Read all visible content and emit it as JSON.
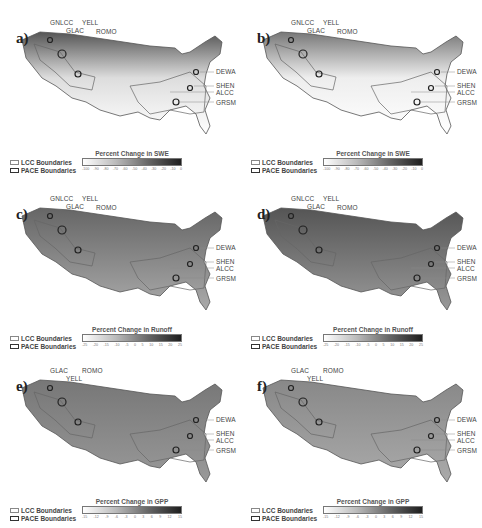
{
  "figure": {
    "panels": [
      {
        "id": "a",
        "label": "a)",
        "variable": "SWE",
        "colorbar_title": "Percent Change in SWE",
        "ticks": [
          "-100",
          "-90",
          "-80",
          "-70",
          "-60",
          "-50",
          "-40",
          "-30",
          "-20",
          "-10",
          "0"
        ],
        "sites_top": [
          "GNLCC",
          "GLAC",
          "YELL",
          "ROMO"
        ],
        "sites_right": [
          "DEWA",
          "SHEN",
          "ALCC",
          "GRSM"
        ]
      },
      {
        "id": "b",
        "label": "b)",
        "variable": "SWE",
        "colorbar_title": "Percent Change in SWE",
        "ticks": [
          "-100",
          "-90",
          "-80",
          "-70",
          "-60",
          "-50",
          "-40",
          "-30",
          "-20",
          "-10",
          "0"
        ],
        "sites_top": [
          "GNLCC",
          "GLAC",
          "YELL",
          "ROMO"
        ],
        "sites_right": [
          "DEWA",
          "SHEN",
          "ALCC",
          "GRSM"
        ]
      },
      {
        "id": "c",
        "label": "c)",
        "variable": "Runoff",
        "colorbar_title": "Percent Change in Runoff",
        "ticks": [
          "-25",
          "-20",
          "-15",
          "-10",
          "-5",
          "0",
          "5",
          "10",
          "15",
          "20",
          "25"
        ],
        "sites_top": [
          "GNLCC",
          "GLAC",
          "YELL",
          "ROMO"
        ],
        "sites_right": [
          "DEWA",
          "SHEN",
          "ALCC",
          "GRSM"
        ]
      },
      {
        "id": "d",
        "label": "d)",
        "variable": "Runoff",
        "colorbar_title": "Percent Change in Runoff",
        "ticks": [
          "-25",
          "-20",
          "-15",
          "-10",
          "-5",
          "0",
          "5",
          "10",
          "15",
          "20",
          "25"
        ],
        "sites_top": [
          "GNLCC",
          "GLAC",
          "YELL",
          "ROMO"
        ],
        "sites_right": [
          "DEWA",
          "SHEN",
          "ALCC",
          "GRSM"
        ]
      },
      {
        "id": "e",
        "label": "e)",
        "variable": "GPP",
        "colorbar_title": "Percent Change in GPP",
        "ticks": [
          "-15",
          "-12",
          "-9",
          "-6",
          "-3",
          "0",
          "3",
          "6",
          "9",
          "12",
          "15"
        ],
        "sites_top": [
          "GLAC",
          "YELL",
          "ROMO"
        ],
        "sites_right": [
          "DEWA",
          "SHEN",
          "ALCC",
          "GRSM"
        ]
      },
      {
        "id": "f",
        "label": "f)",
        "variable": "GPP",
        "colorbar_title": "Percent Change in GPP",
        "ticks": [
          "-15",
          "-12",
          "-9",
          "-6",
          "-3",
          "0",
          "3",
          "6",
          "9",
          "12",
          "15"
        ],
        "sites_top": [
          "GLAC",
          "YELL",
          "ROMO"
        ],
        "sites_right": [
          "DEWA",
          "SHEN",
          "ALCC",
          "GRSM"
        ]
      }
    ],
    "legend": {
      "lcc": "LCC Boundaries",
      "pace": "PACE Boundaries"
    },
    "colors": {
      "ramp_light": "#ffffff",
      "ramp_dark": "#1e1e1e",
      "outline": "#555555"
    }
  }
}
